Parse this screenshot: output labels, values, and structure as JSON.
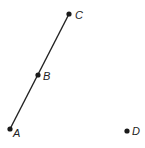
{
  "diagram": {
    "points": [
      {
        "name": "A",
        "x": 10,
        "y": 129,
        "label_dx": 3,
        "label_dy": 8
      },
      {
        "name": "B",
        "x": 38,
        "y": 75,
        "label_dx": 5,
        "label_dy": 5
      },
      {
        "name": "C",
        "x": 69,
        "y": 14,
        "label_dx": 6,
        "label_dy": 5
      },
      {
        "name": "D",
        "x": 127,
        "y": 131,
        "label_dx": 5,
        "label_dy": 4
      }
    ],
    "segment": {
      "from": "A",
      "to": "C",
      "through": "B"
    },
    "colors": {
      "line": "#222222",
      "point": "#1a1a1a",
      "label": "#222222"
    }
  }
}
